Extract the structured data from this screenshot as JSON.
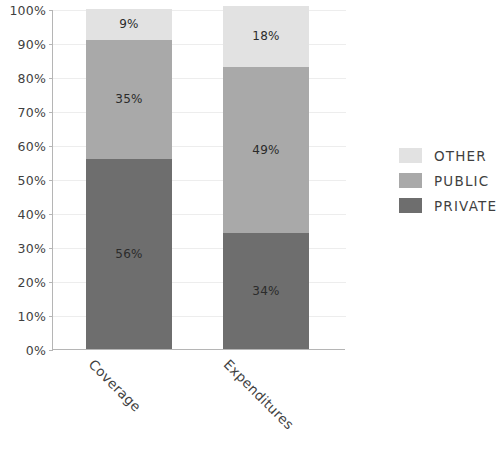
{
  "chart_data": {
    "type": "bar",
    "subtype": "stacked-percentage-column",
    "title": "",
    "subtitle": "",
    "xlabel": "",
    "ylabel": "",
    "categories": [
      "Coverage",
      "Expenditures"
    ],
    "series": [
      {
        "name": "PRIVATE",
        "values": [
          56,
          34
        ],
        "color": "#6e6e6e"
      },
      {
        "name": "PUBLIC",
        "values": [
          35,
          49
        ],
        "color": "#a9a9a9"
      },
      {
        "name": "OTHER",
        "values": [
          9,
          18
        ],
        "color": "#e2e2e2"
      }
    ],
    "stack_order_bottom_to_top": [
      "PRIVATE",
      "PUBLIC",
      "OTHER"
    ],
    "data_labels": {
      "Coverage": {
        "PRIVATE": "56%",
        "PUBLIC": "35%",
        "OTHER": "9%"
      },
      "Expenditures": {
        "PRIVATE": "34%",
        "PUBLIC": "49%",
        "OTHER": "18%"
      }
    },
    "ylim": [
      0,
      100
    ],
    "y_tick_labels": [
      "100%",
      "90%",
      "80%",
      "70%",
      "60%",
      "50%",
      "40%",
      "30%",
      "20%",
      "10%",
      "0%"
    ],
    "y_tick_values": [
      100,
      90,
      80,
      70,
      60,
      50,
      40,
      30,
      20,
      10,
      0
    ],
    "grid": true,
    "grid_axis": "y",
    "legend_position": "right",
    "legend_entries": [
      "OTHER",
      "PUBLIC",
      "PRIVATE"
    ],
    "x_label_rotation_degrees": 45,
    "axis_color": "#b5b5b5",
    "grid_color": "#ededed"
  },
  "axis": {
    "y_ticks": [
      {
        "label": "100%",
        "value": 100
      },
      {
        "label": "90%",
        "value": 90
      },
      {
        "label": "80%",
        "value": 80
      },
      {
        "label": "70%",
        "value": 70
      },
      {
        "label": "60%",
        "value": 60
      },
      {
        "label": "50%",
        "value": 50
      },
      {
        "label": "40%",
        "value": 40
      },
      {
        "label": "30%",
        "value": 30
      },
      {
        "label": "20%",
        "value": 20
      },
      {
        "label": "10%",
        "value": 10
      },
      {
        "label": "0%",
        "value": 0
      }
    ],
    "x_categories": [
      {
        "label": "Coverage"
      },
      {
        "label": "Expenditures"
      }
    ]
  },
  "bars": [
    {
      "category": "Coverage",
      "segments": [
        {
          "series": "OTHER",
          "value": 9,
          "label": "9%",
          "color": "#e2e2e2"
        },
        {
          "series": "PUBLIC",
          "value": 35,
          "label": "35%",
          "color": "#a9a9a9"
        },
        {
          "series": "PRIVATE",
          "value": 56,
          "label": "56%",
          "color": "#6e6e6e"
        }
      ]
    },
    {
      "category": "Expenditures",
      "segments": [
        {
          "series": "OTHER",
          "value": 18,
          "label": "18%",
          "color": "#e2e2e2"
        },
        {
          "series": "PUBLIC",
          "value": 49,
          "label": "49%",
          "color": "#a9a9a9"
        },
        {
          "series": "PRIVATE",
          "value": 34,
          "label": "34%",
          "color": "#6e6e6e"
        }
      ]
    }
  ],
  "legend": {
    "items": [
      {
        "label": "OTHER",
        "color": "#e2e2e2"
      },
      {
        "label": "PUBLIC",
        "color": "#a9a9a9"
      },
      {
        "label": "PRIVATE",
        "color": "#6e6e6e"
      }
    ]
  }
}
